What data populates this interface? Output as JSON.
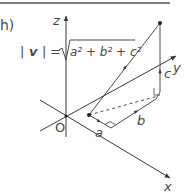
{
  "figure": {
    "part_label": "h)",
    "formula": {
      "lhs_bar_left": "|",
      "lhs_var": "v",
      "lhs_bar_right": "|",
      "equals": "=",
      "radicand": "a² + b² + c²"
    },
    "axes": {
      "x_label": "x",
      "y_label": "y",
      "z_label": "z",
      "origin_label": "O"
    },
    "edge_labels": {
      "a": "a",
      "b": "b",
      "c": "c"
    },
    "colors": {
      "line": "#3a3a3a",
      "text": "#4a4a4a",
      "rule": "#555555"
    }
  }
}
